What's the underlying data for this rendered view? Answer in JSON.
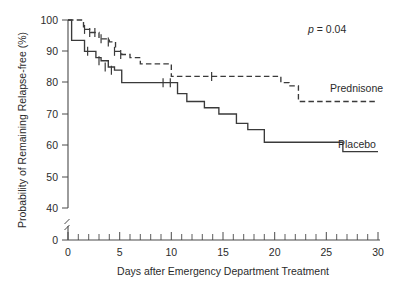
{
  "chart_data": {
    "type": "line",
    "subtype": "kaplan-meier-step",
    "title": "",
    "xlabel": "Days after Emergency Department Treatment",
    "ylabel": "Probability of Remaining Relapse-free (%)",
    "xlim": [
      0,
      30
    ],
    "ylim": [
      0,
      100
    ],
    "y_axis_break": true,
    "y_break_between": [
      0,
      40
    ],
    "grid": false,
    "legend_position": "inline-right-of-curves",
    "x_ticks_major": [
      0,
      5,
      10,
      15,
      20,
      25,
      30
    ],
    "x_tick_labels": [
      "0",
      "5",
      "10",
      "15",
      "20",
      "25",
      "30"
    ],
    "x_tick_minor_interval": 1,
    "y_ticks": [
      0,
      40,
      50,
      60,
      70,
      80,
      90,
      100
    ],
    "y_tick_labels": [
      "0",
      "40",
      "50",
      "60",
      "70",
      "80",
      "90",
      "100"
    ],
    "annotations": [
      {
        "name": "p-value",
        "text": "p = 0.04",
        "p_symbol": "p",
        "operator": "=",
        "value": "0.04"
      }
    ],
    "series": [
      {
        "name": "Prednisone",
        "label": "Prednisone",
        "linestyle": "dashed",
        "color": "#3a3a3a",
        "final_value": 74,
        "steps_x": [
          0,
          1.0,
          1.5,
          2.2,
          3.0,
          4.0,
          4.6,
          5.2,
          6.0,
          7.0,
          9.3,
          10.0,
          19.6,
          20.6,
          21.4,
          22.3,
          30.0
        ],
        "steps_y": [
          100,
          100,
          97,
          96,
          94,
          93,
          90,
          89,
          88,
          86,
          86,
          82,
          82,
          80,
          79,
          74,
          74
        ],
        "censor_marks_x": [
          1.6,
          2.1,
          2.6,
          3.2,
          3.9,
          4.5,
          5.1,
          13.9
        ],
        "censor_marks_y": [
          97,
          96,
          96,
          94,
          93,
          90,
          89,
          82
        ]
      },
      {
        "name": "Placebo",
        "label": "Placebo",
        "linestyle": "solid",
        "color": "#3a3a3a",
        "final_value": 58,
        "steps_x": [
          0,
          0.35,
          1.0,
          1.6,
          2.2,
          2.7,
          3.2,
          3.9,
          4.5,
          5.2,
          6.0,
          7.2,
          8.3,
          9.3,
          10.0,
          10.6,
          11.5,
          13.2,
          14.6,
          16.3,
          17.4,
          19.0,
          21.5,
          25.8,
          26.6,
          30.0
        ],
        "steps_y": [
          100,
          93.5,
          93.5,
          90,
          90,
          88,
          87,
          85,
          84,
          80,
          80,
          80,
          80,
          80,
          80,
          76.5,
          74,
          72,
          70,
          67,
          65,
          61,
          61,
          61,
          58,
          58
        ],
        "censor_marks_x": [
          1.9,
          3.0,
          3.6,
          4.2,
          9.2,
          9.9
        ],
        "censor_marks_y": [
          90,
          87,
          85,
          84,
          80,
          80
        ]
      }
    ]
  },
  "axes": {
    "y_title": "Probability of Remaining Relapse-free (%)",
    "x_title": "Days after Emergency Department Treatment"
  },
  "labels": {
    "prednisone": "Prednisone",
    "placebo": "Placebo",
    "pvalue_italic": "p",
    "pvalue_rest": " = 0.04"
  },
  "colors": {
    "ink": "#3a3a3a",
    "axis": "#4a4a4a",
    "background": "#ffffff"
  }
}
